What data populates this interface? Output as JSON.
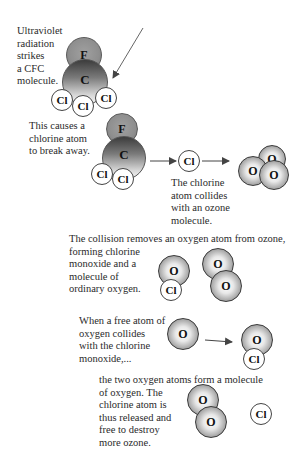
{
  "diagram": {
    "steps": [
      {
        "id": 1,
        "caption": "Ultraviolet\nradiation\nstrikes\na CFC\nmolecule."
      },
      {
        "id": 2,
        "caption": "This causes a\nchlorine atom\nto break away."
      },
      {
        "id": 3,
        "caption": "The chlorine\natom collides\nwith an ozone\nmolecule."
      },
      {
        "id": 4,
        "caption": "The collision removes an oxygen atom from ozone,\nforming chlorine\nmonoxide and a\nmolecule of\nordinary oxygen."
      },
      {
        "id": 5,
        "caption": "When a free atom of\noxygen collides\nwith the chlorine\nmonoxide,..."
      },
      {
        "id": 6,
        "caption": "the two oxygen atoms form a molecule\nof oxygen. The\nchlorine atom is\nthus released and\nfree to destroy\nmore ozone."
      }
    ],
    "atom_labels": {
      "fluorine": "F",
      "carbon": "C",
      "chlorine": "Cl",
      "oxygen": "O"
    },
    "colors": {
      "fluorine": "#8e8e8e",
      "carbon_top": "#3c3c3c",
      "carbon_bottom": "#f4f4f4",
      "chlorine": "#ffffff",
      "oxygen_edge": "#4a4a4a",
      "arrow": "#555555"
    }
  }
}
